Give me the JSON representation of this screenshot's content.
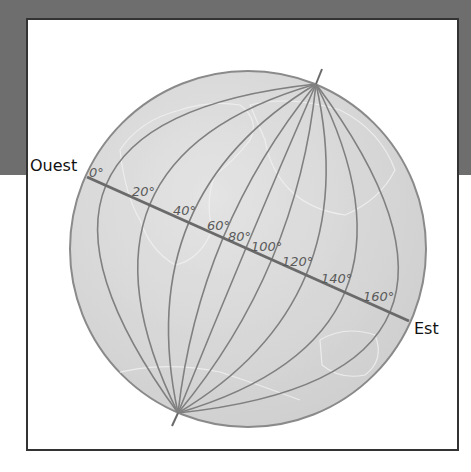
{
  "diagram": {
    "type": "globe-meridians",
    "labels": {
      "west": "Ouest",
      "east": "Est"
    },
    "colors": {
      "background_band": "#6e6e6e",
      "frame_border": "#333333",
      "globe_fill": "#d9d9d9",
      "globe_edge": "#8a8a8a",
      "meridian": "#808080",
      "equator": "#6a6a6a",
      "label_text": "#5a5a5a",
      "direction_text": "#111111"
    },
    "globe": {
      "cx": 248,
      "cy": 249,
      "r": 178
    },
    "north_pole": {
      "x": 316,
      "y": 84,
      "axis_tip_x": 322,
      "axis_tip_y": 69
    },
    "south_pole": {
      "x": 178,
      "y": 413,
      "axis_tip_x": 172,
      "axis_tip_y": 426
    },
    "equator": {
      "x1": 87,
      "y1": 177,
      "x2": 409,
      "y2": 321
    },
    "meridians": [
      {
        "label": "0°",
        "cross_x": 106,
        "cross_y": 185,
        "label_x": 89,
        "label_y": 177
      },
      {
        "label": "20°",
        "cross_x": 150,
        "cross_y": 204,
        "label_x": 132,
        "label_y": 196
      },
      {
        "label": "40°",
        "cross_x": 189,
        "cross_y": 222,
        "label_x": 173,
        "label_y": 215
      },
      {
        "label": "60°",
        "cross_x": 223,
        "cross_y": 238,
        "label_x": 207,
        "label_y": 230
      },
      {
        "label": "80°",
        "cross_x": 246,
        "cross_y": 248,
        "label_x": 228,
        "label_y": 241
      },
      {
        "label": "100°",
        "cross_x": 272,
        "cross_y": 259,
        "label_x": 251,
        "label_y": 251
      },
      {
        "label": "120°",
        "cross_x": 306,
        "cross_y": 275,
        "label_x": 282,
        "label_y": 266
      },
      {
        "label": "140°",
        "cross_x": 345,
        "cross_y": 292,
        "label_x": 321,
        "label_y": 283
      },
      {
        "label": "160°",
        "cross_x": 390,
        "cross_y": 312,
        "label_x": 363,
        "label_y": 301
      }
    ]
  }
}
